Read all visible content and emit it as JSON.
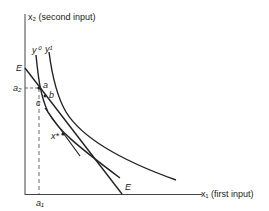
{
  "diagram": {
    "axes": {
      "y_label": "x₂ (second input)",
      "x_label": "x₁ (first input)"
    },
    "isoquants": [
      {
        "name": "y⁰",
        "label": "y⁰"
      },
      {
        "name": "y¹",
        "label": "y¹"
      }
    ],
    "isocost_line": {
      "label_top": "E",
      "label_bottom": "E"
    },
    "points": {
      "a": "a",
      "b": "b",
      "c": "c",
      "x_star": "x*"
    },
    "ticks": {
      "a1": "a₁",
      "a2": "a₂"
    },
    "colors": {
      "ink": "#222222",
      "background": "#ffffff"
    }
  }
}
